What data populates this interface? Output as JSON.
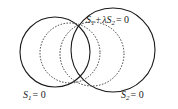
{
  "figure": {
    "background_color": "#ffffff",
    "stroke_color": "#1a1a1a",
    "width": 178,
    "height": 109,
    "labels": {
      "family": {
        "text": "S1 + λS2 = 0",
        "var1": "S",
        "sub1": "1",
        "plus": "+",
        "lambda": "λ",
        "var2": "S",
        "sub2": "2",
        "equals": "= 0"
      },
      "circle1": {
        "text": "S1 = 0",
        "var": "S",
        "sub": "1",
        "equals": "= 0"
      },
      "circle2": {
        "text": "S2 = 0",
        "var": "S",
        "sub": "2",
        "equals": "= 0"
      }
    },
    "shapes": [
      {
        "name": "circle-s1",
        "style": "solid",
        "cx": 55,
        "cy": 52,
        "r": 35
      },
      {
        "name": "circle-s2",
        "style": "solid",
        "cx": 113,
        "cy": 50,
        "r": 42
      },
      {
        "name": "circle-family-left",
        "style": "dotted",
        "cx": 70,
        "cy": 53,
        "r": 30
      },
      {
        "name": "circle-family-right",
        "style": "dotted",
        "cx": 92,
        "cy": 54,
        "r": 32
      }
    ]
  }
}
